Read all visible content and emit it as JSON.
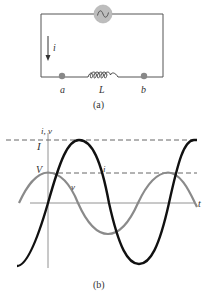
{
  "figure_a": {
    "caption": "(a)",
    "current_label": "i",
    "node_a_label": "a",
    "inductor_label": "L",
    "node_b_label": "b",
    "source_symbol": "~",
    "colors": {
      "wire": "#555555",
      "source_fill": "#b8b8b8",
      "node_fill": "#888888"
    }
  },
  "figure_b": {
    "caption": "(b)",
    "y_axis_label": "i, v",
    "x_axis_label": "t",
    "current_amplitude_label": "I",
    "voltage_amplitude_label": "V",
    "current_curve_label": "i",
    "voltage_curve_label": "v",
    "colors": {
      "current": "#111111",
      "voltage": "#8a8a8a",
      "axis": "#777777",
      "dashed": "#555555"
    }
  }
}
